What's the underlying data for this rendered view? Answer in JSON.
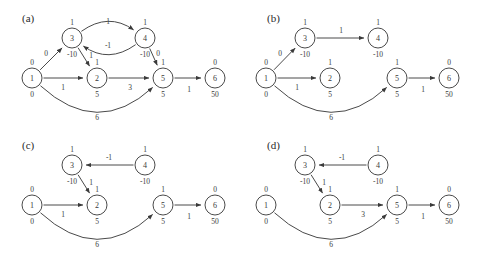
{
  "figure": {
    "width": 489,
    "height": 253,
    "background": "#ffffff",
    "stroke_color": "#4a4a4a",
    "text_color": "#3a3a3a"
  },
  "panels": [
    {
      "key": "a",
      "label": "(a)",
      "label_pos": {
        "x": 22,
        "y": 22
      },
      "nodes": [
        {
          "id": "1",
          "x": 32,
          "y": 78,
          "r": 10,
          "above": "0",
          "below": "0"
        },
        {
          "id": "2",
          "x": 97,
          "y": 78,
          "r": 10,
          "above": "1",
          "below": "5"
        },
        {
          "id": "3",
          "x": 72,
          "y": 38,
          "r": 10,
          "above": "1",
          "below": "-10"
        },
        {
          "id": "4",
          "x": 145,
          "y": 38,
          "r": 10,
          "above": "1",
          "below": "-10"
        },
        {
          "id": "5",
          "x": 163,
          "y": 78,
          "r": 10,
          "above": "1",
          "below": "5"
        },
        {
          "id": "6",
          "x": 215,
          "y": 78,
          "r": 10,
          "above": "0",
          "below": "50"
        }
      ],
      "edges": [
        {
          "from": "1",
          "to": "3",
          "label": "0",
          "label_pos": {
            "x": 46,
            "y": 56
          },
          "curve": 0
        },
        {
          "from": "1",
          "to": "2",
          "label": "1",
          "label_pos": {
            "x": 63,
            "y": 90
          },
          "curve": 0
        },
        {
          "from": "3",
          "to": "2",
          "label": "1",
          "label_pos": {
            "x": 91,
            "y": 58
          },
          "curve": 0
        },
        {
          "from": "3",
          "to": "4",
          "label": "1",
          "label_pos": {
            "x": 108,
            "y": 24
          },
          "curve": -13
        },
        {
          "from": "4",
          "to": "3",
          "label": "-1",
          "label_pos": {
            "x": 108,
            "y": 48
          },
          "curve": -13
        },
        {
          "from": "4",
          "to": "5",
          "label": "0",
          "label_pos": {
            "x": 158,
            "y": 56
          },
          "curve": 0
        },
        {
          "from": "2",
          "to": "5",
          "label": "3",
          "label_pos": {
            "x": 130,
            "y": 90
          },
          "curve": 0
        },
        {
          "from": "5",
          "to": "6",
          "label": "1",
          "label_pos": {
            "x": 189,
            "y": 92
          },
          "curve": 0
        },
        {
          "from": "1",
          "to": "5",
          "label": "6",
          "label_pos": {
            "x": 97,
            "y": 120
          },
          "curve": 30
        }
      ]
    },
    {
      "key": "b",
      "label": "(b)",
      "label_pos": {
        "x": 267,
        "y": 22
      },
      "nodes": [
        {
          "id": "1",
          "x": 266,
          "y": 78,
          "r": 10,
          "above": "0",
          "below": "0"
        },
        {
          "id": "2",
          "x": 330,
          "y": 78,
          "r": 10,
          "above": "1",
          "below": "5"
        },
        {
          "id": "3",
          "x": 305,
          "y": 38,
          "r": 10,
          "above": "1",
          "below": "-10"
        },
        {
          "id": "4",
          "x": 378,
          "y": 38,
          "r": 10,
          "above": "1",
          "below": "-10"
        },
        {
          "id": "5",
          "x": 397,
          "y": 78,
          "r": 10,
          "above": "1",
          "below": "5"
        },
        {
          "id": "6",
          "x": 449,
          "y": 78,
          "r": 10,
          "above": "0",
          "below": "50"
        }
      ],
      "edges": [
        {
          "from": "1",
          "to": "3",
          "label": "0",
          "label_pos": {
            "x": 280,
            "y": 56
          },
          "curve": 0
        },
        {
          "from": "1",
          "to": "2",
          "label": "1",
          "label_pos": {
            "x": 297,
            "y": 90
          },
          "curve": 0
        },
        {
          "from": "3",
          "to": "4",
          "label": "1",
          "label_pos": {
            "x": 341,
            "y": 33
          },
          "curve": 0
        },
        {
          "from": "5",
          "to": "6",
          "label": "1",
          "label_pos": {
            "x": 423,
            "y": 92
          },
          "curve": 0
        },
        {
          "from": "1",
          "to": "5",
          "label": "6",
          "label_pos": {
            "x": 331,
            "y": 120
          },
          "curve": 30
        }
      ]
    },
    {
      "key": "c",
      "label": "(c)",
      "label_pos": {
        "x": 22,
        "y": 149
      },
      "nodes": [
        {
          "id": "1",
          "x": 32,
          "y": 205,
          "r": 10,
          "above": "0",
          "below": "0"
        },
        {
          "id": "2",
          "x": 97,
          "y": 205,
          "r": 10,
          "above": "1",
          "below": "5"
        },
        {
          "id": "3",
          "x": 72,
          "y": 165,
          "r": 10,
          "above": "1",
          "below": "-10"
        },
        {
          "id": "4",
          "x": 145,
          "y": 165,
          "r": 10,
          "above": "1",
          "below": "-10"
        },
        {
          "id": "5",
          "x": 163,
          "y": 205,
          "r": 10,
          "above": "1",
          "below": "5"
        },
        {
          "id": "6",
          "x": 215,
          "y": 205,
          "r": 10,
          "above": "0",
          "below": "50"
        }
      ],
      "edges": [
        {
          "from": "4",
          "to": "3",
          "label": "-1",
          "label_pos": {
            "x": 109,
            "y": 160
          },
          "curve": 0
        },
        {
          "from": "3",
          "to": "2",
          "label": "1",
          "label_pos": {
            "x": 91,
            "y": 185
          },
          "curve": 0
        },
        {
          "from": "1",
          "to": "2",
          "label": "1",
          "label_pos": {
            "x": 63,
            "y": 217
          },
          "curve": 0
        },
        {
          "from": "5",
          "to": "6",
          "label": "1",
          "label_pos": {
            "x": 189,
            "y": 219
          },
          "curve": 0
        },
        {
          "from": "1",
          "to": "5",
          "label": "6",
          "label_pos": {
            "x": 97,
            "y": 247
          },
          "curve": 30
        }
      ]
    },
    {
      "key": "d",
      "label": "(d)",
      "label_pos": {
        "x": 267,
        "y": 149
      },
      "nodes": [
        {
          "id": "1",
          "x": 266,
          "y": 205,
          "r": 10,
          "above": "0",
          "below": "0"
        },
        {
          "id": "2",
          "x": 330,
          "y": 205,
          "r": 10,
          "above": "1",
          "below": "5"
        },
        {
          "id": "3",
          "x": 305,
          "y": 165,
          "r": 10,
          "above": "1",
          "below": "-10"
        },
        {
          "id": "4",
          "x": 378,
          "y": 165,
          "r": 10,
          "above": "1",
          "below": "-10"
        },
        {
          "id": "5",
          "x": 397,
          "y": 205,
          "r": 10,
          "above": "1",
          "below": "5"
        },
        {
          "id": "6",
          "x": 449,
          "y": 205,
          "r": 10,
          "above": "0",
          "below": "50"
        }
      ],
      "edges": [
        {
          "from": "4",
          "to": "3",
          "label": "-1",
          "label_pos": {
            "x": 342,
            "y": 160
          },
          "curve": 0
        },
        {
          "from": "3",
          "to": "2",
          "label": "1",
          "label_pos": {
            "x": 324,
            "y": 185
          },
          "curve": 0
        },
        {
          "from": "2",
          "to": "5",
          "label": "3",
          "label_pos": {
            "x": 363,
            "y": 217
          },
          "curve": 0
        },
        {
          "from": "5",
          "to": "6",
          "label": "1",
          "label_pos": {
            "x": 423,
            "y": 219
          },
          "curve": 0
        },
        {
          "from": "1",
          "to": "5",
          "label": "6",
          "label_pos": {
            "x": 331,
            "y": 247
          },
          "curve": 30
        }
      ]
    }
  ]
}
